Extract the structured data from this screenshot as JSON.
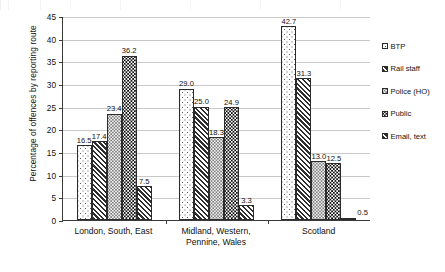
{
  "chart_data": {
    "type": "bar",
    "title": "",
    "xlabel": "",
    "ylabel": "Percentage of offences by reporting route",
    "ylim": [
      0,
      45
    ],
    "ytick_step": 5,
    "yticks": [
      "0",
      "5",
      "10",
      "15",
      "20",
      "25",
      "30",
      "35",
      "40",
      "45"
    ],
    "grid": true,
    "legend_position": "right",
    "categories": [
      "London, South, East",
      "Midland, Western, Pennine, Wales",
      "Scotland"
    ],
    "category_lines": [
      [
        "London, South, East"
      ],
      [
        "Midland, Western,",
        "Pennine, Wales"
      ],
      [
        "Scotland"
      ]
    ],
    "series": [
      {
        "name": "BTP",
        "pattern": "light-dots",
        "values": [
          16.5,
          29.0,
          42.7
        ],
        "labels": [
          "16.5",
          "29.0",
          "42.7"
        ]
      },
      {
        "name": "Rail staff",
        "pattern": "diagonal-hatch",
        "values": [
          17.4,
          25.0,
          31.3
        ],
        "labels": [
          "17.4",
          "25.0",
          "31.3"
        ]
      },
      {
        "name": "Police (HO)",
        "pattern": "fine-dots",
        "values": [
          23.4,
          18.3,
          13.0
        ],
        "labels": [
          "23.4",
          "18.3",
          "13.0"
        ]
      },
      {
        "name": "Public",
        "pattern": "black-dots",
        "values": [
          36.2,
          24.9,
          12.5
        ],
        "labels": [
          "36.2",
          "24.9",
          "12.5"
        ]
      },
      {
        "name": "Email, text",
        "pattern": "diagonal-hatch",
        "values": [
          7.5,
          3.3,
          0.5
        ],
        "labels": [
          "7.5",
          "3.3",
          "0.5"
        ]
      }
    ]
  },
  "legend": {
    "items": [
      {
        "label": "BTP",
        "swatch": "light-dots"
      },
      {
        "label": "Rail staff",
        "swatch": "diagonal-hatch"
      },
      {
        "label": "Police (HO)",
        "swatch": "fine-dots"
      },
      {
        "label": "Public",
        "swatch": "black-dots"
      },
      {
        "label": "Email, text",
        "swatch": "diagonal-hatch"
      }
    ]
  },
  "colors": {
    "axis": "#3a3a3a",
    "grid": "#c9c9c9",
    "bar_outline": "#2b2b2b",
    "text": "#111111",
    "background": "#ffffff"
  }
}
